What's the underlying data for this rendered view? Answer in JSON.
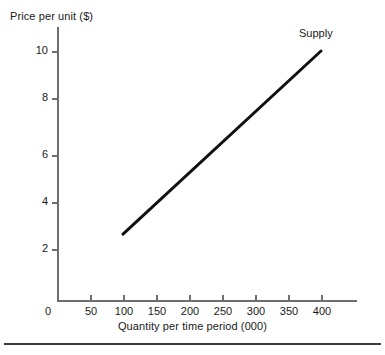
{
  "chart_data": {
    "type": "line",
    "title": "",
    "subtitle": "",
    "xlabel": "Quantity per time period (000)",
    "ylabel": "Price per unit ($)",
    "xlim": [
      0,
      450
    ],
    "ylim": [
      0,
      11
    ],
    "grid": false,
    "legend_position": "inline-right-top",
    "xticks": [
      0,
      50,
      100,
      150,
      200,
      250,
      300,
      350,
      400
    ],
    "xtick_labels": [
      "0",
      "50",
      "100",
      "150",
      "200",
      "250",
      "300",
      "350",
      "400"
    ],
    "yticks": [
      2,
      4,
      6,
      8,
      10
    ],
    "ytick_labels": [
      "2",
      "4",
      "6",
      "8",
      "10"
    ],
    "series": [
      {
        "name": "Supply",
        "color": "#111111",
        "linewidth": 3,
        "x": [
          100,
          400
        ],
        "y": [
          2.6,
          10.0
        ],
        "annotation": "Supply"
      }
    ],
    "axis_color": "#6e6e6e",
    "background": "#ffffff"
  },
  "annotations": {
    "supply_label": "Supply"
  }
}
